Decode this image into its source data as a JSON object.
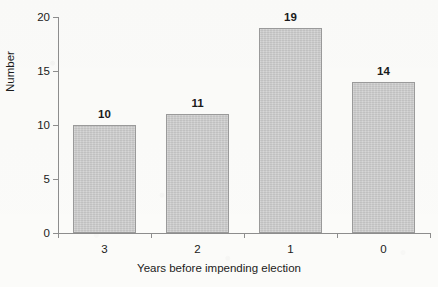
{
  "chart_data": {
    "type": "bar",
    "title": "",
    "categories": [
      "3",
      "2",
      "1",
      "0"
    ],
    "values": [
      10,
      11,
      19,
      14
    ],
    "value_labels": [
      "10",
      "11",
      "19",
      "14"
    ],
    "xlabel": "Years before impending election",
    "ylabel": "Number",
    "ylim": [
      0,
      20
    ],
    "ytick_labels": [
      "0",
      "5",
      "10",
      "15",
      "20"
    ],
    "ytick_values": [
      0,
      5,
      10,
      15,
      20
    ],
    "grid": false,
    "legend": "none",
    "bar_fill_color": "#c9c9c9",
    "bar_border_color": "#9a9a9a",
    "axis_color": "#8d8d8d",
    "text_color": "#1b1b1b",
    "background_color": "#fbfbf9"
  }
}
